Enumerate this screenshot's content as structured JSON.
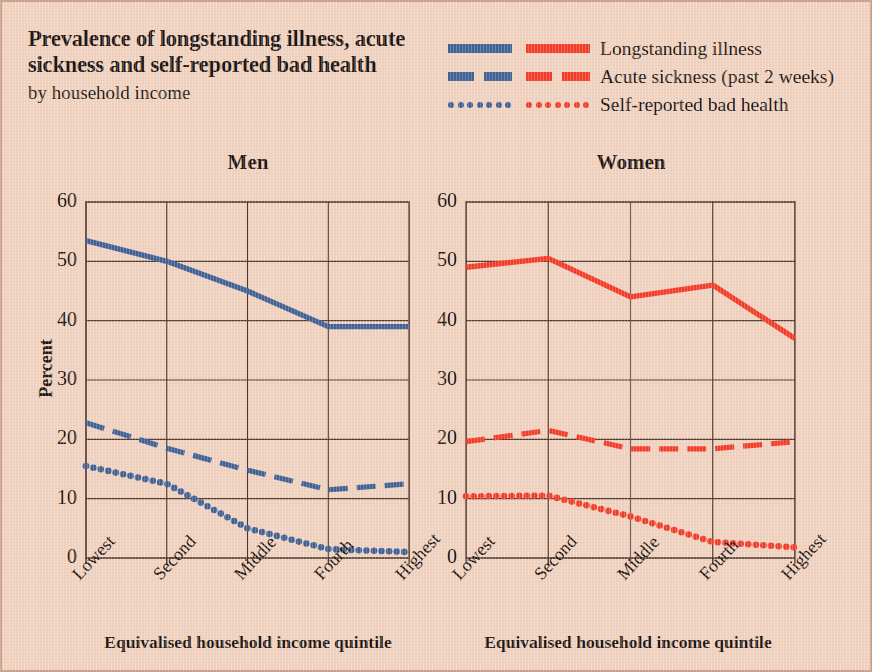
{
  "title": "Prevalence of longstanding illness, acute sickness and self-reported bad health",
  "subtitle": "by household income",
  "colors": {
    "background": "#f0d2c0",
    "men_series": "#3d6196",
    "women_series": "#f23b28",
    "axis": "#4a3328",
    "text": "#1b1410"
  },
  "legend": {
    "position": "top-right",
    "entries": [
      {
        "label": "Longstanding illness",
        "style": "solid",
        "men_color": "#3d6196",
        "women_color": "#f23b28"
      },
      {
        "label": "Acute sickness (past 2 weeks)",
        "style": "dashed",
        "men_color": "#3d6196",
        "women_color": "#f23b28"
      },
      {
        "label": "Self-reported bad health",
        "style": "dotted",
        "men_color": "#3d6196",
        "women_color": "#f23b28"
      }
    ]
  },
  "axis": {
    "ylabel": "Percent",
    "xlabel": "Equivalised household income quintile",
    "yticks": [
      "60",
      "50",
      "40",
      "30",
      "20",
      "10",
      "0"
    ],
    "xticks": [
      "Lowest",
      "Second",
      "Middle",
      "Fourth",
      "Highest"
    ]
  },
  "chart_data": [
    {
      "type": "line",
      "title": "Men",
      "xlabel": "Equivalised household income quintile",
      "ylabel": "Percent",
      "categories": [
        "Lowest",
        "Second",
        "Middle",
        "Fourth",
        "Highest"
      ],
      "ylim": [
        0,
        60
      ],
      "yticks": [
        0,
        10,
        20,
        30,
        40,
        50,
        60
      ],
      "grid": true,
      "color": "#3d6196",
      "series": [
        {
          "name": "Longstanding illness",
          "style": "solid",
          "values": [
            53.5,
            50.0,
            45.0,
            39.0,
            39.0
          ]
        },
        {
          "name": "Acute sickness (past 2 weeks)",
          "style": "dashed",
          "values": [
            22.8,
            18.5,
            14.8,
            11.5,
            12.5
          ]
        },
        {
          "name": "Self-reported bad health",
          "style": "dotted",
          "values": [
            15.5,
            12.5,
            5.0,
            1.5,
            1.0
          ]
        }
      ]
    },
    {
      "type": "line",
      "title": "Women",
      "xlabel": "Equivalised household income quintile",
      "ylabel": "Percent",
      "categories": [
        "Lowest",
        "Second",
        "Middle",
        "Fourth",
        "Highest"
      ],
      "ylim": [
        0,
        60
      ],
      "yticks": [
        0,
        10,
        20,
        30,
        40,
        50,
        60
      ],
      "grid": true,
      "color": "#f23b28",
      "series": [
        {
          "name": "Longstanding illness",
          "style": "solid",
          "values": [
            49.0,
            50.5,
            44.0,
            46.0,
            37.0
          ]
        },
        {
          "name": "Acute sickness (past 2 weeks)",
          "style": "dashed",
          "values": [
            19.6,
            21.5,
            18.4,
            18.4,
            19.6
          ]
        },
        {
          "name": "Self-reported bad health",
          "style": "dotted",
          "values": [
            10.4,
            10.5,
            7.0,
            2.7,
            1.8
          ]
        }
      ]
    }
  ]
}
